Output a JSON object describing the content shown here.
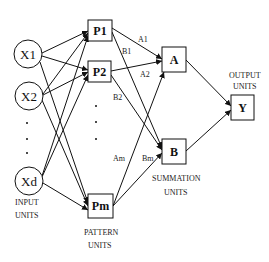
{
  "diagram": {
    "type": "grnn-network",
    "input_units": {
      "nodes": [
        "X1",
        "X2",
        "Xd"
      ],
      "caption_line1": "INPUT",
      "caption_line2": "UNITS"
    },
    "pattern_units": {
      "nodes": [
        "P1",
        "P2",
        "Pm"
      ],
      "caption_line1": "PATTERN",
      "caption_line2": "UNITS"
    },
    "summation_units": {
      "nodes": [
        "A",
        "B"
      ],
      "caption_line1": "SUMMATION",
      "caption_line2": "UNITS"
    },
    "output_units": {
      "nodes": [
        "Y"
      ],
      "caption_line1": "OUTPUT",
      "caption_line2": "UNITS"
    },
    "weights": {
      "A1": "A1",
      "B1": "B1",
      "A2": "A2",
      "B2": "B2",
      "Am": "Am",
      "Bm": "Bm"
    },
    "edges": [
      [
        "X1",
        "P1"
      ],
      [
        "X1",
        "P2"
      ],
      [
        "X1",
        "Pm"
      ],
      [
        "X2",
        "P1"
      ],
      [
        "X2",
        "P2"
      ],
      [
        "X2",
        "Pm"
      ],
      [
        "Xd",
        "P1"
      ],
      [
        "Xd",
        "P2"
      ],
      [
        "Xd",
        "Pm"
      ],
      [
        "P1",
        "A"
      ],
      [
        "P1",
        "B"
      ],
      [
        "P2",
        "A"
      ],
      [
        "P2",
        "B"
      ],
      [
        "Pm",
        "A"
      ],
      [
        "Pm",
        "B"
      ],
      [
        "A",
        "Y"
      ],
      [
        "B",
        "Y"
      ]
    ]
  }
}
